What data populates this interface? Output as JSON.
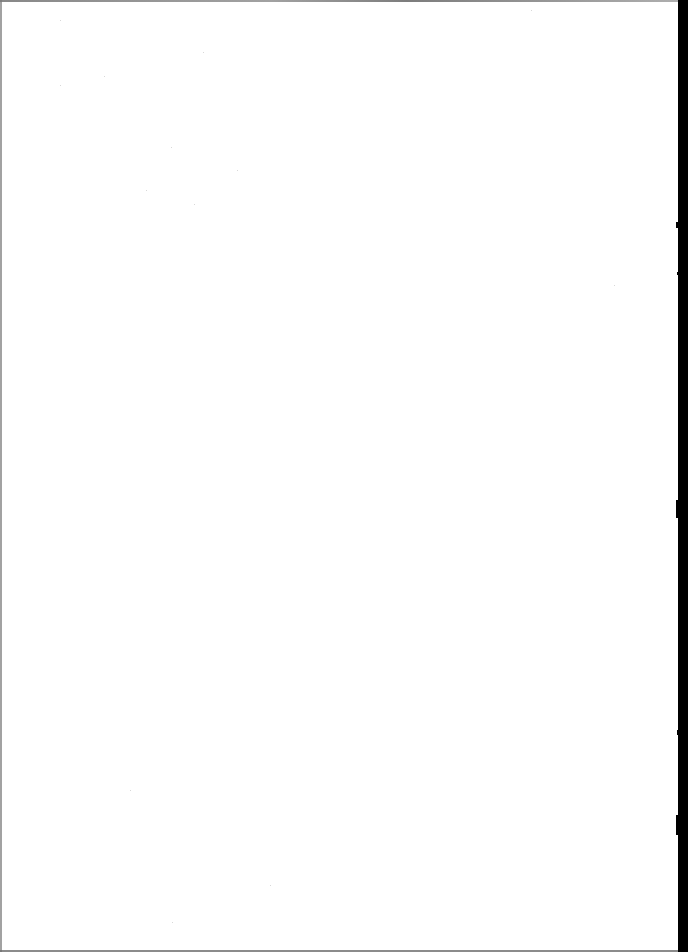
{
  "page": {
    "type": "blank-scanned-page",
    "width": 688,
    "height": 952,
    "background_color": "#ffffff",
    "border_color": "#7a7a7a",
    "right_edge_color": "#000000",
    "right_edge_start_x": 678,
    "text_content": ""
  }
}
